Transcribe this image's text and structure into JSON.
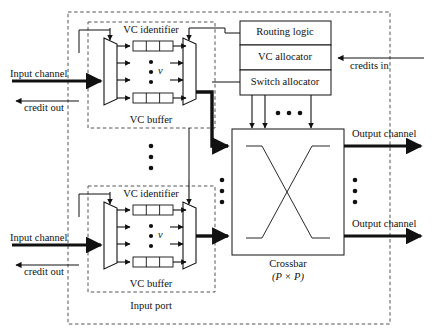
{
  "figure": {
    "type": "block-diagram"
  },
  "boundaries": {
    "router_label": "",
    "input_port_label": "Input port"
  },
  "control": {
    "routing_logic": "Routing logic",
    "vc_allocator": "VC allocator",
    "switch_allocator": "Switch allocator"
  },
  "ports": [
    {
      "vc_identifier_label": "VC identifier",
      "vc_buffer_label": "VC buffer",
      "vc_count_symbol": "v",
      "input_channel_label": "Input channel",
      "credit_out_label": "credit out"
    },
    {
      "vc_identifier_label": "VC identifier",
      "vc_buffer_label": "VC buffer",
      "vc_count_symbol": "v",
      "input_channel_label": "Input channel",
      "credit_out_label": "credit out"
    }
  ],
  "crossbar": {
    "name": "Crossbar",
    "size": "(P × P)"
  },
  "signals": {
    "credits_in": "credits in",
    "output_channel_top": "Output channel",
    "output_channel_bottom": "Output channel"
  },
  "colors": {
    "stroke": "#111111",
    "dashed": "#555555",
    "background": "#ffffff"
  }
}
